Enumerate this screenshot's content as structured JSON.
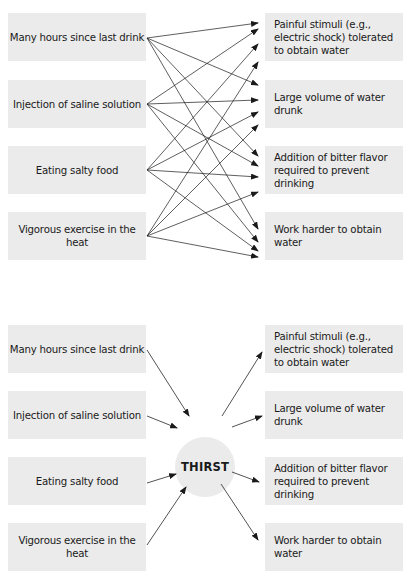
{
  "top_diagram": {
    "causes": [
      "Many hours since last drink",
      "Injection of saline solution",
      "Eating salty food",
      "Vigorous exercise in the heat"
    ],
    "effects": [
      "Painful stimuli (e.g., electric shock) tolerated to obtain water",
      "Large volume of water drunk",
      "Addition of bitter flavor required to prevent drinking",
      "Work harder to obtain water"
    ],
    "connection_style": "every cause linked by arrow to every effect"
  },
  "bottom_diagram": {
    "causes": [
      "Many hours since last drink",
      "Injection of saline solution",
      "Eating salty food",
      "Vigorous exercise in the heat"
    ],
    "hub_label": "THIRST",
    "effects": [
      "Painful stimuli (e.g., electric shock) tolerated to obtain water",
      "Large volume of water drunk",
      "Addition of bitter flavor required to prevent drinking",
      "Work harder to obtain water"
    ]
  },
  "colors": {
    "box_fill": "#ebebeb",
    "arrow": "#1a1a1a",
    "background": "#ffffff"
  }
}
